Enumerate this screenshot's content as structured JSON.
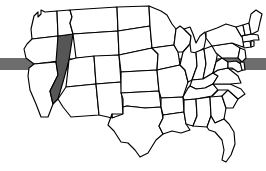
{
  "graphic": {
    "kind": "us-states-map",
    "background_color": "#ffffff",
    "outline_color": "#000000",
    "default_state_fill": "#ffffff",
    "highlight_fill": "#565656",
    "highlighted_states": [
      "Nevada"
    ],
    "width": 266,
    "height": 171
  },
  "overlay_bar": {
    "name": "horizontal-gray-bar",
    "color": "#6d6d6d",
    "x": 0,
    "y": 58,
    "width": 266,
    "height": 12,
    "behind_map": true,
    "visible_left_segment": [
      0,
      22
    ],
    "visible_right_segment": [
      232,
      266
    ]
  },
  "states": [
    {
      "code": "WA",
      "name": "Washington",
      "highlighted": false
    },
    {
      "code": "OR",
      "name": "Oregon",
      "highlighted": false
    },
    {
      "code": "CA",
      "name": "California",
      "highlighted": false
    },
    {
      "code": "NV",
      "name": "Nevada",
      "highlighted": true
    },
    {
      "code": "ID",
      "name": "Idaho",
      "highlighted": false
    },
    {
      "code": "MT",
      "name": "Montana",
      "highlighted": false
    },
    {
      "code": "WY",
      "name": "Wyoming",
      "highlighted": false
    },
    {
      "code": "UT",
      "name": "Utah",
      "highlighted": false
    },
    {
      "code": "AZ",
      "name": "Arizona",
      "highlighted": false
    },
    {
      "code": "CO",
      "name": "Colorado",
      "highlighted": false
    },
    {
      "code": "NM",
      "name": "New Mexico",
      "highlighted": false
    },
    {
      "code": "ND",
      "name": "North Dakota",
      "highlighted": false
    },
    {
      "code": "SD",
      "name": "South Dakota",
      "highlighted": false
    },
    {
      "code": "NE",
      "name": "Nebraska",
      "highlighted": false
    },
    {
      "code": "KS",
      "name": "Kansas",
      "highlighted": false
    },
    {
      "code": "OK",
      "name": "Oklahoma",
      "highlighted": false
    },
    {
      "code": "TX",
      "name": "Texas",
      "highlighted": false
    },
    {
      "code": "MN",
      "name": "Minnesota",
      "highlighted": false
    },
    {
      "code": "IA",
      "name": "Iowa",
      "highlighted": false
    },
    {
      "code": "MO",
      "name": "Missouri",
      "highlighted": false
    },
    {
      "code": "AR",
      "name": "Arkansas",
      "highlighted": false
    },
    {
      "code": "LA",
      "name": "Louisiana",
      "highlighted": false
    },
    {
      "code": "WI",
      "name": "Wisconsin",
      "highlighted": false
    },
    {
      "code": "IL",
      "name": "Illinois",
      "highlighted": false
    },
    {
      "code": "MI",
      "name": "Michigan",
      "highlighted": false
    },
    {
      "code": "IN",
      "name": "Indiana",
      "highlighted": false
    },
    {
      "code": "OH",
      "name": "Ohio",
      "highlighted": false
    },
    {
      "code": "KY",
      "name": "Kentucky",
      "highlighted": false
    },
    {
      "code": "TN",
      "name": "Tennessee",
      "highlighted": false
    },
    {
      "code": "MS",
      "name": "Mississippi",
      "highlighted": false
    },
    {
      "code": "AL",
      "name": "Alabama",
      "highlighted": false
    },
    {
      "code": "GA",
      "name": "Georgia",
      "highlighted": false
    },
    {
      "code": "FL",
      "name": "Florida",
      "highlighted": false
    },
    {
      "code": "SC",
      "name": "South Carolina",
      "highlighted": false
    },
    {
      "code": "NC",
      "name": "North Carolina",
      "highlighted": false
    },
    {
      "code": "VA",
      "name": "Virginia",
      "highlighted": false
    },
    {
      "code": "WV",
      "name": "West Virginia",
      "highlighted": false
    },
    {
      "code": "MD",
      "name": "Maryland",
      "highlighted": false
    },
    {
      "code": "DE",
      "name": "Delaware",
      "highlighted": false
    },
    {
      "code": "PA",
      "name": "Pennsylvania",
      "highlighted": false
    },
    {
      "code": "NJ",
      "name": "New Jersey",
      "highlighted": false
    },
    {
      "code": "NY",
      "name": "New York",
      "highlighted": false
    },
    {
      "code": "CT",
      "name": "Connecticut",
      "highlighted": false
    },
    {
      "code": "RI",
      "name": "Rhode Island",
      "highlighted": false
    },
    {
      "code": "MA",
      "name": "Massachusetts",
      "highlighted": false
    },
    {
      "code": "VT",
      "name": "Vermont",
      "highlighted": false
    },
    {
      "code": "NH",
      "name": "New Hampshire",
      "highlighted": false
    },
    {
      "code": "ME",
      "name": "Maine",
      "highlighted": false
    }
  ]
}
